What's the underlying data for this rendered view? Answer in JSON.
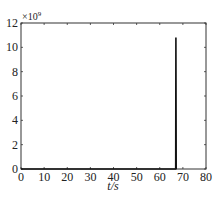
{
  "chart_data": {
    "type": "line",
    "title": "",
    "xlabel": "t/s",
    "ylabel": "",
    "y_multiplier": "×10^9",
    "xlim": [
      0,
      80
    ],
    "ylim": [
      0,
      12
    ],
    "x_ticks": [
      0,
      10,
      20,
      30,
      40,
      50,
      60,
      70,
      80
    ],
    "y_ticks": [
      0,
      2,
      4,
      6,
      8,
      10,
      12
    ],
    "grid": false,
    "legend": null,
    "series": [
      {
        "name": "signal",
        "x": [
          0,
          66.9,
          67,
          67.1
        ],
        "y": [
          0,
          0,
          10.8,
          0
        ]
      }
    ]
  },
  "labels": {
    "x_axis": "t/s",
    "multiplier_base": "×10",
    "multiplier_exp": "9"
  }
}
